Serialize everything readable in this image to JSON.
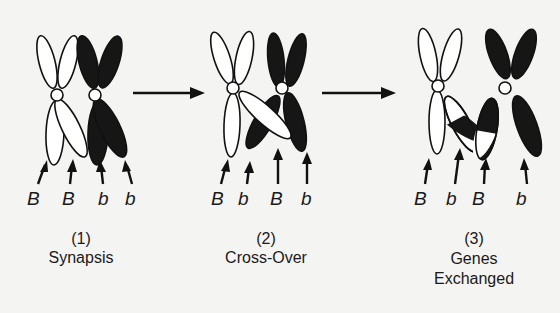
{
  "diagram": {
    "stages": [
      {
        "number": "(1)",
        "title_lines": [
          "Synapsis"
        ],
        "alleles": [
          "B",
          "B",
          "b",
          "b"
        ]
      },
      {
        "number": "(2)",
        "title_lines": [
          "Cross-Over"
        ],
        "alleles": [
          "B",
          "b",
          "B",
          "b"
        ]
      },
      {
        "number": "(3)",
        "title_lines": [
          "Genes",
          "Exchanged"
        ],
        "alleles": [
          "B",
          "b",
          "B",
          "b"
        ]
      }
    ],
    "transitions": [
      "arrow-1-to-2",
      "arrow-2-to-3"
    ],
    "colors": {
      "paternal_chromosome": "#ffffff",
      "maternal_chromosome": "#161616",
      "outline": "#111111",
      "background": "#f4f4f2"
    }
  }
}
